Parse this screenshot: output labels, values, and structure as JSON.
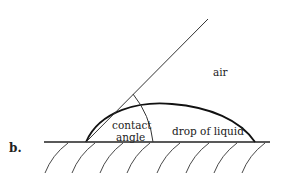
{
  "figure": {
    "label": "b."
  },
  "labels": {
    "air": "air",
    "contact_line1": "contact",
    "contact_line2": "angle",
    "drop": "drop of liquid"
  },
  "colors": {
    "ink": "#222222",
    "background": "#ffffff"
  },
  "elements": {
    "surface": "solid surface baseline with hatch marks",
    "drop_profile": "curved drop profile",
    "tangent_line": "tangent line at contact point",
    "angle_arc": "arc marking the contact angle"
  }
}
